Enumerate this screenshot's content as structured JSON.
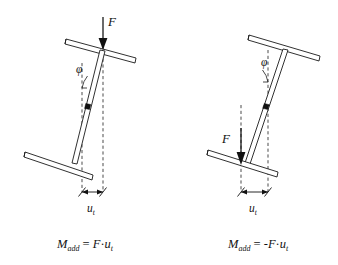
{
  "figure": {
    "background_color": "#ffffff",
    "line_color": "#111111",
    "dashed_color": "#2b2b2b"
  },
  "panels": [
    {
      "id": "left-panel",
      "name": "positive-moment-case",
      "force": {
        "label": "F",
        "direction": "down",
        "position": "top"
      },
      "angle": {
        "label": "φ",
        "name": "tilt-angle"
      },
      "displacement": {
        "label": "u",
        "subscript": "t",
        "name": "tip-displacement"
      },
      "formula": {
        "lhs": "M",
        "lhs_sub": "add",
        "equals": "=",
        "rhs_sign": "",
        "rhs_force": "F",
        "rhs_dot": "·",
        "rhs_u": "u",
        "rhs_u_sub": "t",
        "full": "M_add = F·u_t"
      },
      "elements": {
        "top_plate": "top-plate",
        "bottom_plate": "bottom-plate",
        "column": "column",
        "hinge": "mid-hinge"
      }
    },
    {
      "id": "right-panel",
      "name": "negative-moment-case",
      "force": {
        "label": "F",
        "direction": "down",
        "position": "bottom"
      },
      "angle": {
        "label": "φ",
        "name": "tilt-angle"
      },
      "displacement": {
        "label": "u",
        "subscript": "t",
        "name": "tip-displacement"
      },
      "formula": {
        "lhs": "M",
        "lhs_sub": "add",
        "equals": "=",
        "rhs_sign": "-",
        "rhs_force": "F",
        "rhs_dot": "·",
        "rhs_u": "u",
        "rhs_u_sub": "t",
        "full": "M_add = -F·u_t"
      },
      "elements": {
        "top_plate": "top-plate",
        "bottom_plate": "bottom-plate",
        "column": "column",
        "hinge": "mid-hinge"
      }
    }
  ]
}
